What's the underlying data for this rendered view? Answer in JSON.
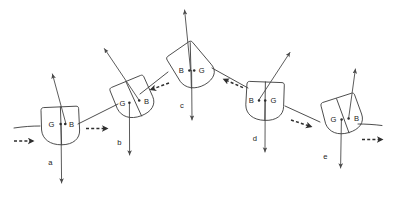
{
  "diagram": {
    "type": "ship-stability-wave",
    "background_color": "#ffffff",
    "line_color": "#3a3a3a",
    "arrow_color": "#4a4a4a",
    "wave_arrow_color": "#2e2e2e",
    "label_color": "#1c1c1c"
  },
  "points": {
    "gravity_label": "G",
    "buoyancy_label": "B"
  },
  "hulls": [
    {
      "id": "hull-a",
      "segment_label": "a",
      "heel": "upright",
      "left_point": "G",
      "right_point": "B",
      "position": "wave-trough-left",
      "weight_arrow": "down",
      "buoyancy_arrow": "up"
    },
    {
      "id": "hull-b",
      "segment_label": "b",
      "heel": "heeled-starboard",
      "left_point": "G",
      "right_point": "B",
      "position": "wave-upslope",
      "weight_arrow": "down",
      "buoyancy_arrow": "up-left"
    },
    {
      "id": "hull-c",
      "segment_label": "c",
      "heel": "upright-crest",
      "left_point": "B",
      "right_point": "G",
      "position": "wave-crest",
      "weight_arrow": "down",
      "buoyancy_arrow": "up"
    },
    {
      "id": "hull-d",
      "segment_label": "d",
      "heel": "heeled-port",
      "left_point": "B",
      "right_point": "G",
      "position": "wave-downslope",
      "weight_arrow": "down",
      "buoyancy_arrow": "up-right"
    },
    {
      "id": "hull-e",
      "segment_label": "e",
      "heel": "heeled-slight",
      "left_point": "G",
      "right_point": "B",
      "position": "wave-trough-right",
      "weight_arrow": "down",
      "buoyancy_arrow": "up"
    }
  ],
  "wave_arrows": [
    {
      "id": "wave-arrow-1",
      "direction": "right",
      "near": "hull-a"
    },
    {
      "id": "wave-arrow-2",
      "direction": "right",
      "near": "hull-b"
    },
    {
      "id": "wave-arrow-3",
      "direction": "down-left",
      "near": "hull-c"
    },
    {
      "id": "wave-arrow-4",
      "direction": "up-left",
      "near": "hull-c"
    },
    {
      "id": "wave-arrow-5",
      "direction": "right",
      "near": "hull-e"
    },
    {
      "id": "wave-arrow-6",
      "direction": "right",
      "near": "hull-e"
    }
  ]
}
